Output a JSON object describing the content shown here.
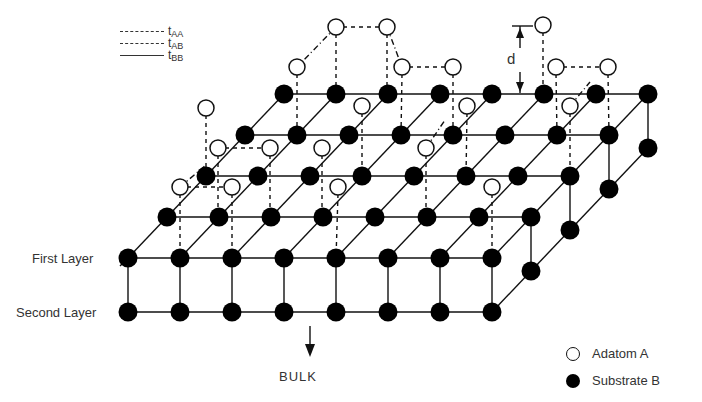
{
  "figure": {
    "bond_key": [
      {
        "symbol": "t",
        "subscript": "AA",
        "style": "dash-dot"
      },
      {
        "symbol": "t",
        "subscript": "AB",
        "style": "dashed"
      },
      {
        "symbol": "t",
        "subscript": "BB",
        "style": "solid"
      }
    ],
    "labels": {
      "first_layer": "First Layer",
      "second_layer": "Second Layer",
      "bulk": "BULK",
      "height": "d"
    },
    "legend": [
      {
        "marker": "open-circle",
        "label": "Adatom A"
      },
      {
        "marker": "filled-circle",
        "label": "Substrate B"
      }
    ],
    "lattice": {
      "columns": 8,
      "rows": 5,
      "layers": 2,
      "origin": [
        128,
        258
      ],
      "column_step": [
        52,
        0
      ],
      "row_step": [
        39,
        -41
      ],
      "layer_step": [
        0,
        54
      ]
    },
    "adatoms": [
      [
        336,
        27,
        336,
        94
      ],
      [
        387,
        27,
        387,
        94
      ],
      [
        543,
        25,
        543,
        94
      ],
      [
        297,
        67,
        297,
        135
      ],
      [
        402,
        67,
        401,
        135
      ],
      [
        453,
        67,
        453,
        135
      ],
      [
        556,
        67,
        557,
        135
      ],
      [
        608,
        67,
        609,
        135
      ],
      [
        206,
        108,
        206,
        176
      ],
      [
        362,
        106,
        362,
        176
      ],
      [
        467,
        106,
        466,
        176
      ],
      [
        570,
        106,
        570,
        176
      ],
      [
        218,
        148,
        218,
        217
      ],
      [
        270,
        148,
        270,
        217
      ],
      [
        322,
        148,
        322,
        217
      ],
      [
        426,
        148,
        426,
        217
      ],
      [
        180,
        187,
        180,
        258
      ],
      [
        232,
        187,
        232,
        258
      ],
      [
        338,
        187,
        336,
        258
      ],
      [
        492,
        187,
        492,
        258
      ]
    ],
    "ab_bonds": [
      [
        336,
        27,
        387,
        27
      ],
      [
        402,
        67,
        453,
        67
      ],
      [
        556,
        67,
        608,
        67
      ],
      [
        218,
        148,
        270,
        148
      ],
      [
        180,
        187,
        232,
        187
      ]
    ],
    "aa_bonds": [
      [
        336,
        27,
        297,
        67
      ],
      [
        387,
        27,
        402,
        67
      ],
      [
        180,
        187,
        206,
        165
      ],
      [
        426,
        148,
        445,
        120
      ],
      [
        570,
        106,
        590,
        82
      ]
    ]
  }
}
